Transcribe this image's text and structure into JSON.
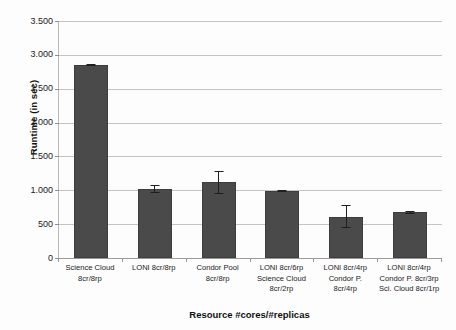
{
  "chart_data": {
    "type": "bar",
    "title": "",
    "subtitle": "",
    "xlabel": "Resource #cores/#replicas",
    "ylabel": "Runtime (in sec)",
    "ylim": [
      0,
      3500
    ],
    "ytick_step": 500,
    "grid": true,
    "legend": "none",
    "bar_color": "#4a4a4a",
    "gridline_color": "#c4c4c4",
    "ytick_labels": [
      "3.500",
      "3.000",
      "2.500",
      "2.000",
      "1.500",
      "1.000",
      "500",
      "0"
    ],
    "ytick_values": [
      3500,
      3000,
      2500,
      2000,
      1500,
      1000,
      500,
      0
    ],
    "categories": [
      "Science Cloud 8cr/8rp",
      "LONI 8cr/8rp",
      "Condor Pool 8cr/8rp",
      "LONI 8cr/6rp Science Cloud 8cr/2rp",
      "LONI 8cr/4rp Condor P. 8cr/4rp",
      "LONI 8cr/4rp Condor P. 8cr/3rp Sci. Cloud 8cr/1rp"
    ],
    "category_lines": [
      [
        "Science Cloud",
        "8cr/8rp"
      ],
      [
        "LONI 8cr/8rp"
      ],
      [
        "Condor Pool",
        "8cr/8rp"
      ],
      [
        "LONI 8cr/6rp",
        "Science Cloud",
        "8cr/2rp"
      ],
      [
        "LONI 8cr/4rp",
        "Condor P.",
        "8cr/4rp"
      ],
      [
        "LONI 8cr/4rp",
        "Condor P. 8cr/3rp",
        "Sci. Cloud 8cr/1rp"
      ]
    ],
    "values": [
      2850,
      1020,
      1120,
      995,
      610,
      675
    ],
    "errors": [
      20,
      60,
      170,
      15,
      170,
      20
    ],
    "series": [
      {
        "name": "Runtime",
        "values": [
          2850,
          1020,
          1120,
          995,
          610,
          675
        ],
        "errors": [
          20,
          60,
          170,
          15,
          170,
          20
        ]
      }
    ]
  }
}
